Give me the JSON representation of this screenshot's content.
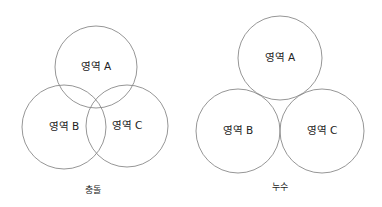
{
  "diagrams": [
    {
      "caption": "충돌",
      "regions": [
        {
          "label": "영역 A",
          "cx": 96,
          "cy": 67,
          "r": 41
        },
        {
          "label": "영역 B",
          "cx": 64,
          "cy": 127,
          "r": 42
        },
        {
          "label": "영역 C",
          "cx": 127,
          "cy": 126,
          "r": 41
        }
      ],
      "caption_pos": {
        "x": 93,
        "y": 190
      }
    },
    {
      "caption": "누수",
      "regions": [
        {
          "label": "영역 A",
          "cx": 280,
          "cy": 58,
          "r": 42
        },
        {
          "label": "영역 B",
          "cx": 238,
          "cy": 131,
          "r": 42
        },
        {
          "label": "영역 C",
          "cx": 322,
          "cy": 131,
          "r": 42
        }
      ],
      "caption_pos": {
        "x": 280,
        "y": 187
      }
    }
  ],
  "colors": {
    "stroke": "#8a8a8a",
    "text": "#222222",
    "background": "#ffffff"
  }
}
